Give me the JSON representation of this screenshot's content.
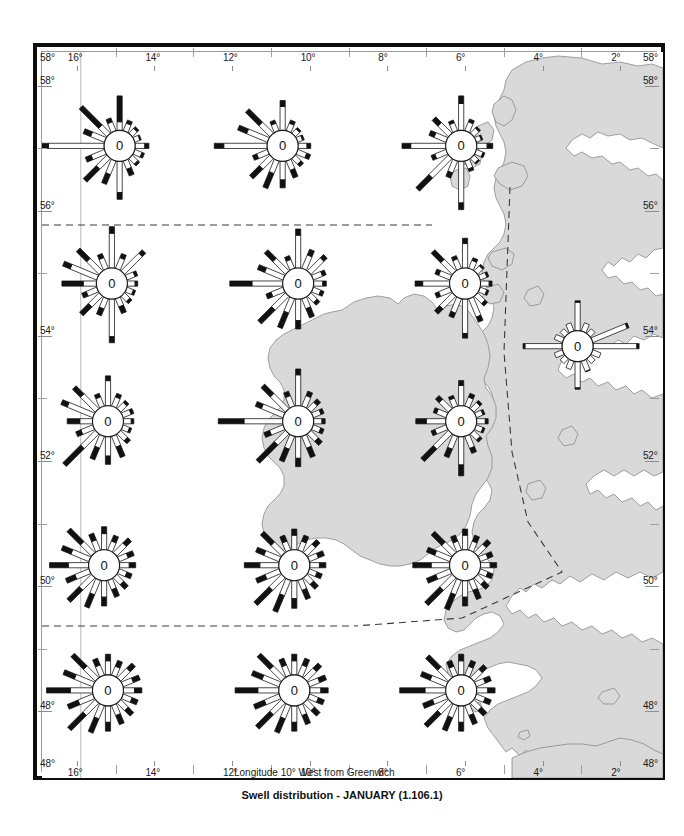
{
  "caption": "Swell distribution - JANUARY (1.106.1)",
  "axes": {
    "x_title": "Longitude 10° West from Greenwich",
    "x_ticks_top": [
      "16°",
      "14°",
      "12°",
      "10°",
      "8°",
      "6°",
      "4°",
      "2°"
    ],
    "x_ticks_bottom": [
      "16°",
      "14°",
      "12°",
      "10°",
      "8°",
      "6°",
      "4°",
      "2°"
    ],
    "y_ticks_left": [
      "58°",
      "56°",
      "54°",
      "52°",
      "50°",
      "48°"
    ],
    "y_ticks_right": [
      "58°",
      "56°",
      "54°",
      "52°",
      "50°",
      "48°"
    ],
    "corner_top_left": "58°",
    "corner_top_right": "58°",
    "corner_bottom_left": "48°",
    "corner_bottom_right": "48°",
    "x_min": 17,
    "x_max": 1,
    "y_min": 47,
    "y_max": 58.6
  },
  "colors": {
    "land_fill": "#d9d9d9",
    "land_stroke": "#8a8a8a",
    "sea_fill": "#ffffff",
    "frame": "#0d0d0d",
    "grid": "#9a9a9a",
    "rose_stroke": "#1a1a1a",
    "rose_fill": "#ffffff",
    "bar_black": "#111111"
  },
  "chart_data": {
    "type": "wind-rose-map",
    "title": "Swell distribution - JANUARY (1.106.1)",
    "xlabel": "Longitude 10° West from Greenwich",
    "ylabel": "Latitude North",
    "center_label": "0",
    "direction_count": 16,
    "direction_names": [
      "N",
      "NNE",
      "NE",
      "ENE",
      "E",
      "ESE",
      "SE",
      "SSE",
      "S",
      "SSW",
      "SW",
      "WSW",
      "W",
      "WNW",
      "NW",
      "NNW"
    ],
    "note": "Each rose plots 16 directional arms; arm length = frequency of swell from that direction, black outer segment = higher sea-state share, '0' in hub = percentage of calm.",
    "roses": [
      {
        "id": "r-58-15",
        "lon": 15.0,
        "lat": 57.1,
        "arms": [
          30,
          10,
          8,
          6,
          12,
          9,
          9,
          14,
          33,
          22,
          29,
          18,
          62,
          20,
          34,
          12
        ],
        "black": [
          0.75,
          0.3,
          0.25,
          0.2,
          0.3,
          0.25,
          0.25,
          0.45,
          0.18,
          0.42,
          0.55,
          0.3,
          0.22,
          0.35,
          0.7,
          0.3
        ]
      },
      {
        "id": "r-58-11",
        "lon": 10.8,
        "lat": 57.1,
        "arms": [
          26,
          10,
          7,
          6,
          11,
          12,
          10,
          16,
          23,
          26,
          25,
          14,
          46,
          28,
          30,
          10
        ],
        "black": [
          0.2,
          0.3,
          0.25,
          0.25,
          0.3,
          0.3,
          0.3,
          0.45,
          0.3,
          0.55,
          0.48,
          0.28,
          0.18,
          0.3,
          0.55,
          0.3
        ]
      },
      {
        "id": "r-58-6",
        "lon": 6.2,
        "lat": 57.1,
        "arms": [
          30,
          11,
          8,
          6,
          14,
          8,
          7,
          10,
          42,
          16,
          40,
          14,
          38,
          16,
          20,
          10
        ],
        "black": [
          0.22,
          0.25,
          0.22,
          0.22,
          0.35,
          0.22,
          0.22,
          0.25,
          0.14,
          0.3,
          0.4,
          0.25,
          0.2,
          0.3,
          0.35,
          0.25
        ]
      },
      {
        "id": "r-55-15",
        "lon": 15.2,
        "lat": 54.9,
        "arms": [
          36,
          14,
          26,
          10,
          9,
          8,
          9,
          14,
          38,
          16,
          24,
          14,
          30,
          32,
          28,
          14
        ],
        "black": [
          0.16,
          0.28,
          0.16,
          0.25,
          0.25,
          0.25,
          0.28,
          0.45,
          0.14,
          0.4,
          0.45,
          0.3,
          0.62,
          0.22,
          0.45,
          0.28
        ]
      },
      {
        "id": "r-55-10",
        "lon": 10.4,
        "lat": 54.9,
        "arms": [
          34,
          18,
          20,
          12,
          11,
          10,
          11,
          18,
          26,
          28,
          34,
          16,
          46,
          24,
          26,
          12
        ],
        "black": [
          0.16,
          0.3,
          0.2,
          0.28,
          0.28,
          0.3,
          0.3,
          0.48,
          0.28,
          0.52,
          0.5,
          0.3,
          0.42,
          0.28,
          0.4,
          0.3
        ]
      },
      {
        "id": "r-55-6",
        "lon": 6.1,
        "lat": 54.9,
        "arms": [
          26,
          10,
          8,
          8,
          10,
          8,
          12,
          22,
          34,
          18,
          22,
          14,
          30,
          14,
          26,
          12
        ],
        "black": [
          0.18,
          0.25,
          0.22,
          0.22,
          0.25,
          0.22,
          0.25,
          0.22,
          0.12,
          0.25,
          0.28,
          0.25,
          0.22,
          0.25,
          0.45,
          0.25
        ]
      },
      {
        "id": "r-53-15",
        "lon": 15.3,
        "lat": 52.7,
        "arms": [
          26,
          12,
          10,
          10,
          9,
          8,
          12,
          20,
          24,
          22,
          40,
          16,
          22,
          30,
          28,
          12
        ],
        "black": [
          0.16,
          0.28,
          0.25,
          0.25,
          0.25,
          0.25,
          0.3,
          0.5,
          0.3,
          0.5,
          0.55,
          0.3,
          0.5,
          0.2,
          0.35,
          0.28
        ]
      },
      {
        "id": "r-53-10",
        "lon": 10.4,
        "lat": 52.7,
        "arms": [
          32,
          14,
          12,
          10,
          10,
          10,
          14,
          20,
          26,
          24,
          36,
          18,
          56,
          26,
          30,
          14
        ],
        "black": [
          0.16,
          0.3,
          0.35,
          0.28,
          0.28,
          0.3,
          0.35,
          0.45,
          0.28,
          0.5,
          0.62,
          0.3,
          0.4,
          0.22,
          0.38,
          0.3
        ]
      },
      {
        "id": "r-53-6",
        "lon": 6.2,
        "lat": 52.7,
        "arms": [
          22,
          12,
          10,
          8,
          10,
          8,
          10,
          16,
          34,
          20,
          34,
          14,
          26,
          12,
          16,
          10
        ],
        "black": [
          0.2,
          0.3,
          0.25,
          0.22,
          0.25,
          0.22,
          0.25,
          0.3,
          0.28,
          0.4,
          0.45,
          0.25,
          0.35,
          0.25,
          0.28,
          0.25
        ]
      },
      {
        "id": "r-54-3",
        "lon": 3.2,
        "lat": 53.9,
        "arms": [
          26,
          8,
          6,
          34,
          40,
          8,
          6,
          10,
          24,
          8,
          6,
          8,
          34,
          8,
          6,
          8
        ],
        "black": [
          0.05,
          0.05,
          0.05,
          0.05,
          0.05,
          0.05,
          0.05,
          0.05,
          0.05,
          0.05,
          0.05,
          0.05,
          0.05,
          0.05,
          0.05,
          0.05
        ]
      },
      {
        "id": "r-50-15",
        "lon": 15.4,
        "lat": 50.4,
        "arms": [
          20,
          14,
          18,
          14,
          14,
          12,
          14,
          16,
          22,
          26,
          30,
          22,
          34,
          26,
          30,
          16
        ],
        "black": [
          0.3,
          0.4,
          0.35,
          0.4,
          0.4,
          0.4,
          0.4,
          0.45,
          0.35,
          0.48,
          0.5,
          0.4,
          0.48,
          0.35,
          0.55,
          0.4
        ]
      },
      {
        "id": "r-50-10",
        "lon": 10.5,
        "lat": 50.4,
        "arms": [
          18,
          14,
          16,
          14,
          14,
          12,
          14,
          18,
          24,
          30,
          34,
          22,
          30,
          22,
          26,
          14
        ],
        "black": [
          0.3,
          0.4,
          0.35,
          0.4,
          0.4,
          0.4,
          0.42,
          0.48,
          0.35,
          0.52,
          0.55,
          0.4,
          0.45,
          0.35,
          0.5,
          0.4
        ]
      },
      {
        "id": "r-50-6",
        "lon": 6.1,
        "lat": 50.4,
        "arms": [
          18,
          14,
          16,
          12,
          14,
          12,
          14,
          18,
          22,
          28,
          34,
          22,
          32,
          22,
          26,
          14
        ],
        "black": [
          0.3,
          0.4,
          0.35,
          0.4,
          0.4,
          0.4,
          0.42,
          0.48,
          0.35,
          0.52,
          0.55,
          0.4,
          0.5,
          0.35,
          0.5,
          0.4
        ]
      },
      {
        "id": "r-48-15",
        "lon": 15.3,
        "lat": 48.4,
        "arms": [
          18,
          14,
          18,
          16,
          16,
          14,
          16,
          18,
          22,
          26,
          34,
          24,
          40,
          28,
          30,
          16
        ],
        "black": [
          0.32,
          0.4,
          0.35,
          0.4,
          0.4,
          0.4,
          0.42,
          0.48,
          0.35,
          0.52,
          0.55,
          0.42,
          0.52,
          0.38,
          0.52,
          0.4
        ]
      },
      {
        "id": "r-48-10",
        "lon": 10.5,
        "lat": 48.4,
        "arms": [
          18,
          16,
          18,
          16,
          16,
          14,
          16,
          18,
          22,
          26,
          32,
          24,
          38,
          26,
          30,
          16
        ],
        "black": [
          0.32,
          0.4,
          0.35,
          0.4,
          0.4,
          0.4,
          0.42,
          0.48,
          0.35,
          0.52,
          0.55,
          0.42,
          0.52,
          0.38,
          0.52,
          0.4
        ]
      },
      {
        "id": "r-48-6",
        "lon": 6.2,
        "lat": 48.4,
        "arms": [
          18,
          14,
          16,
          14,
          16,
          14,
          16,
          18,
          22,
          24,
          30,
          22,
          40,
          24,
          28,
          14
        ],
        "black": [
          0.32,
          0.4,
          0.35,
          0.4,
          0.4,
          0.4,
          0.42,
          0.48,
          0.35,
          0.52,
          0.55,
          0.42,
          0.55,
          0.38,
          0.52,
          0.4
        ]
      }
    ],
    "boundaries": [
      {
        "id": "b-56n",
        "kind": "dashed",
        "points": "0,56 12,56"
      },
      {
        "id": "b-50n",
        "kind": "dashed",
        "points": "0,50 10.2,50"
      },
      {
        "id": "b-irish-sea",
        "kind": "dashed",
        "points": "5.1,55.6 4.9,54.4 5.2,53.2 5.6,52.2 6.6,51.2 8.2,50.4 10.2,50.0"
      }
    ]
  }
}
